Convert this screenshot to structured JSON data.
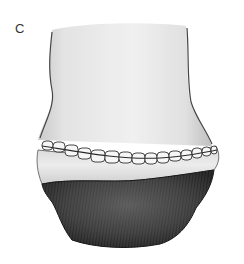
{
  "figure": {
    "panel_label": "C",
    "regions": [
      {
        "name": "upper-limb-shaft",
        "tone": "light-gray"
      },
      {
        "name": "suture-line",
        "stitch_count": 15,
        "tone": "white-with-dark-seams"
      },
      {
        "name": "light-band",
        "tone": "pale-gray"
      },
      {
        "name": "lower-textured-mass",
        "tone": "dark-gray"
      }
    ],
    "colors": {
      "background": "#ffffff",
      "shaft_light": "#f2f2f2",
      "shaft_mid": "#dcdcdc",
      "outline": "#3a3a3a",
      "band": "#e4e4e4",
      "stitch_fill": "#f6f6f6",
      "dark_mass": "#3b3b3b",
      "dark_mass_deep": "#1f1f1f"
    }
  }
}
